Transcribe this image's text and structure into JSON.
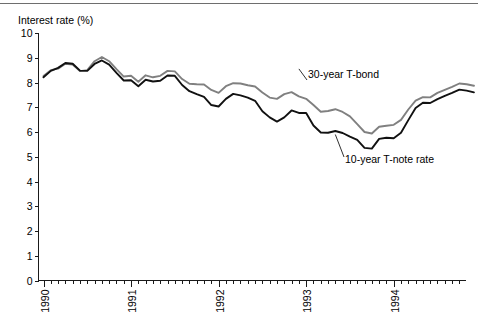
{
  "chart_data": {
    "type": "line",
    "title": "",
    "ylabel": "Interest rate (%)",
    "xlabel": "",
    "ylim": [
      0,
      10
    ],
    "y_ticks": [
      "0",
      "1",
      "2",
      "3",
      "4",
      "5",
      "6",
      "7",
      "8",
      "9",
      "10"
    ],
    "x_tick_labels": [
      "1990",
      "1991",
      "1992",
      "1993",
      "1994"
    ],
    "x_major_positions": [
      0,
      12,
      24,
      36,
      48
    ],
    "x_minor_interval_months": 1,
    "x_range_months": [
      0,
      59
    ],
    "grid": false,
    "legend": "inline-annotations",
    "series": [
      {
        "name": "30-year T-bond",
        "color": "#808080",
        "label_x_months": 35.0,
        "label_y_value": 8.55,
        "values": [
          8.26,
          8.5,
          8.56,
          8.76,
          8.73,
          8.46,
          8.5,
          8.86,
          9.03,
          8.86,
          8.54,
          8.24,
          8.27,
          8.03,
          8.29,
          8.21,
          8.27,
          8.47,
          8.45,
          8.14,
          7.95,
          7.93,
          7.92,
          7.7,
          7.58,
          7.85,
          7.97,
          7.96,
          7.89,
          7.84,
          7.6,
          7.39,
          7.34,
          7.53,
          7.61,
          7.44,
          7.34,
          7.09,
          6.82,
          6.85,
          6.92,
          6.81,
          6.63,
          6.32,
          6.0,
          5.94,
          6.21,
          6.25,
          6.29,
          6.49,
          6.91,
          7.27,
          7.41,
          7.4,
          7.58,
          7.7,
          7.82,
          7.96,
          7.93,
          7.87
        ]
      },
      {
        "name": "10-year T-note rate",
        "color": "#111111",
        "label_x_months": 40.0,
        "label_y_value": 5.05,
        "values": [
          8.21,
          8.47,
          8.59,
          8.79,
          8.76,
          8.48,
          8.47,
          8.75,
          8.89,
          8.72,
          8.39,
          8.08,
          8.09,
          7.85,
          8.11,
          8.04,
          8.07,
          8.28,
          8.27,
          7.9,
          7.65,
          7.53,
          7.42,
          7.09,
          7.03,
          7.34,
          7.54,
          7.48,
          7.39,
          7.26,
          6.84,
          6.59,
          6.42,
          6.59,
          6.87,
          6.77,
          6.77,
          6.26,
          5.98,
          5.97,
          6.04,
          5.96,
          5.81,
          5.68,
          5.36,
          5.33,
          5.72,
          5.77,
          5.75,
          5.97,
          6.48,
          6.97,
          7.18,
          7.17,
          7.33,
          7.46,
          7.58,
          7.71,
          7.67,
          7.6
        ]
      }
    ]
  },
  "axis": {
    "y_title": "Interest rate (%)"
  }
}
